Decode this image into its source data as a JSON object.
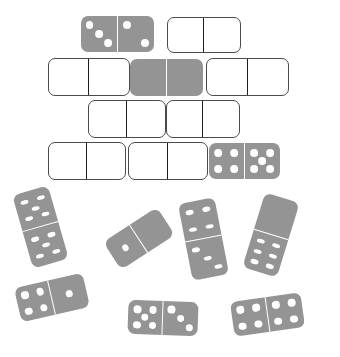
{
  "scene": {
    "title": "Dominoes scene",
    "background_color": "#ffffff",
    "tile_gray": "#949494",
    "tile_white": "#ffffff",
    "outline_color": "#4a4a4a",
    "pip_white": "#ffffff",
    "pip_dark": "#3b3b3b",
    "divider_dark": "#1c1c1c",
    "divider_white": "#ffffff"
  },
  "wall": {
    "description": "Brick-like stacked arrangement of four rows of horizontal dominoes in the upper half",
    "rows": [
      {
        "row_index": 0,
        "tiles": [
          {
            "id": "wall-r0-t0",
            "fill": "gray",
            "left": 81,
            "top": 16,
            "width": 73,
            "height": 36,
            "values": [
              3,
              2
            ]
          },
          {
            "id": "wall-r0-t1",
            "fill": "white",
            "left": 167,
            "top": 17,
            "width": 74,
            "height": 36,
            "values": [
              0,
              0
            ]
          }
        ]
      },
      {
        "row_index": 1,
        "tiles": [
          {
            "id": "wall-r1-t0",
            "fill": "white",
            "left": 48,
            "top": 58,
            "width": 82,
            "height": 38,
            "values": [
              0,
              0
            ]
          },
          {
            "id": "wall-r1-t1",
            "fill": "gray",
            "left": 130,
            "top": 59,
            "width": 73,
            "height": 37,
            "values": [
              0,
              0
            ]
          },
          {
            "id": "wall-r1-t2",
            "fill": "white",
            "left": 206,
            "top": 58,
            "width": 83,
            "height": 38,
            "values": [
              0,
              0
            ]
          }
        ]
      },
      {
        "row_index": 2,
        "tiles": [
          {
            "id": "wall-r2-t0",
            "fill": "white",
            "left": 88,
            "top": 100,
            "width": 78,
            "height": 38,
            "values": [
              0,
              0
            ]
          },
          {
            "id": "wall-r2-t1",
            "fill": "white",
            "left": 166,
            "top": 100,
            "width": 74,
            "height": 38,
            "values": [
              0,
              0
            ]
          }
        ]
      },
      {
        "row_index": 3,
        "tiles": [
          {
            "id": "wall-r3-t0",
            "fill": "white",
            "left": 48,
            "top": 142,
            "width": 78,
            "height": 38,
            "values": [
              0,
              0
            ]
          },
          {
            "id": "wall-r3-t1",
            "fill": "white",
            "left": 128,
            "top": 142,
            "width": 80,
            "height": 38,
            "values": [
              0,
              0
            ]
          },
          {
            "id": "wall-r3-t2",
            "fill": "gray",
            "left": 209,
            "top": 143,
            "width": 71,
            "height": 36,
            "values": [
              4,
              5
            ]
          }
        ]
      }
    ]
  },
  "scattered": {
    "description": "Loose gray dominoes tilted at various angles in the lower half",
    "tiles": [
      {
        "id": "loose-0",
        "fill": "gray",
        "left": 22,
        "top": 189,
        "width": 37,
        "height": 76,
        "rotate": -16,
        "orientation": "v",
        "values": [
          5,
          5
        ]
      },
      {
        "id": "loose-1",
        "fill": "gray",
        "left": 107,
        "top": 222,
        "width": 64,
        "height": 33,
        "rotate": -33,
        "orientation": "h",
        "values": [
          1,
          0
        ]
      },
      {
        "id": "loose-2",
        "fill": "gray",
        "left": 185,
        "top": 200,
        "width": 37,
        "height": 78,
        "rotate": -11,
        "orientation": "v",
        "values": [
          4,
          3
        ]
      },
      {
        "id": "loose-3",
        "fill": "gray",
        "left": 253,
        "top": 196,
        "width": 36,
        "height": 78,
        "rotate": 17,
        "orientation": "v",
        "values": [
          0,
          6
        ]
      },
      {
        "id": "loose-4",
        "fill": "gray",
        "left": 17,
        "top": 280,
        "width": 70,
        "height": 35,
        "rotate": -13,
        "orientation": "h",
        "values": [
          4,
          1
        ]
      },
      {
        "id": "loose-5",
        "fill": "gray",
        "left": 128,
        "top": 301,
        "width": 70,
        "height": 34,
        "rotate": 2,
        "orientation": "h",
        "values": [
          5,
          3
        ]
      },
      {
        "id": "loose-6",
        "fill": "gray",
        "left": 232,
        "top": 297,
        "width": 71,
        "height": 35,
        "rotate": -8,
        "orientation": "h",
        "values": [
          4,
          4
        ]
      }
    ]
  },
  "pip_layouts": {
    "0": [],
    "1": [
      [
        50,
        50
      ]
    ],
    "2": [
      [
        26,
        26
      ],
      [
        74,
        74
      ]
    ],
    "3": [
      [
        24,
        24
      ],
      [
        50,
        50
      ],
      [
        76,
        76
      ]
    ],
    "4": [
      [
        27,
        27
      ],
      [
        73,
        27
      ],
      [
        27,
        73
      ],
      [
        73,
        73
      ]
    ],
    "5": [
      [
        27,
        27
      ],
      [
        73,
        27
      ],
      [
        50,
        50
      ],
      [
        27,
        73
      ],
      [
        73,
        73
      ]
    ],
    "6": [
      [
        27,
        22
      ],
      [
        73,
        22
      ],
      [
        27,
        50
      ],
      [
        73,
        50
      ],
      [
        27,
        78
      ],
      [
        73,
        78
      ]
    ]
  }
}
